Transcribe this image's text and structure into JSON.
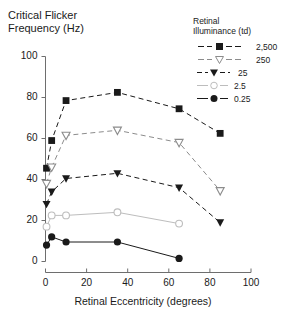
{
  "chart_data": {
    "type": "line",
    "title": "Critical Flicker Frequency (Hz)",
    "ylabel": "Critical Flicker Frequency (Hz)",
    "xlabel": "Retinal Eccentricity (degrees)",
    "xlim": [
      0,
      100
    ],
    "ylim": [
      0,
      100
    ],
    "xticks": [
      0,
      20,
      40,
      60,
      80,
      100
    ],
    "xtick_labels": [
      "0",
      "20",
      "40",
      "60",
      "80",
      "100"
    ],
    "yticks": [
      0,
      20,
      40,
      60,
      80,
      100
    ],
    "ytick_labels": [
      "0",
      "20",
      "40",
      "60",
      "80",
      "100"
    ],
    "grid": false,
    "legend_title": "Retinal Illuminance (td)",
    "legend_position": "top-right",
    "series": [
      {
        "name": "2,500",
        "marker": "filled-square",
        "color": "#1a1a1a",
        "linestyle": "dashed",
        "x": [
          0.5,
          3,
          10,
          35,
          65,
          85
        ],
        "values": [
          45.5,
          59,
          78.5,
          82.5,
          74.5,
          62.5
        ]
      },
      {
        "name": "250",
        "marker": "open-down-triangle",
        "color": "#8c8c8c",
        "linestyle": "dashed",
        "x": [
          0.5,
          3,
          10,
          35,
          65,
          85
        ],
        "values": [
          38,
          46,
          61.5,
          64,
          58,
          34.5
        ]
      },
      {
        "name": "25",
        "marker": "filled-down-triangle",
        "color": "#1a1a1a",
        "linestyle": "dashed",
        "x": [
          0.5,
          3,
          10,
          35,
          65,
          85
        ],
        "values": [
          28,
          34,
          40.5,
          43,
          36,
          19
        ]
      },
      {
        "name": "2.5",
        "marker": "open-circle",
        "color": "#bdbdbd",
        "linestyle": "solid",
        "x": [
          0.5,
          3,
          10,
          35,
          65
        ],
        "values": [
          17,
          22.5,
          22.5,
          24,
          18.5
        ]
      },
      {
        "name": "0.25",
        "marker": "filled-circle",
        "color": "#1a1a1a",
        "linestyle": "solid",
        "x": [
          0.5,
          3,
          10,
          35,
          65
        ],
        "values": [
          8,
          12,
          9.5,
          9.5,
          1.5
        ]
      }
    ]
  },
  "axes": {
    "y_title_text": "Critical Flicker\nFrequency (Hz)",
    "x_title_text": "Retinal Eccentricity (degrees)"
  },
  "legend": {
    "title_text": "Retinal\nIlluminance (td)",
    "items": [
      {
        "label": "2,500"
      },
      {
        "label": "250"
      },
      {
        "label": "25"
      },
      {
        "label": "2.5"
      },
      {
        "label": "0.25"
      }
    ]
  },
  "colors": {
    "axis": "#6e6e6e",
    "text": "#1a1a1a",
    "dark": "#1a1a1a",
    "mid_gray": "#8c8c8c",
    "light_gray": "#bdbdbd"
  }
}
